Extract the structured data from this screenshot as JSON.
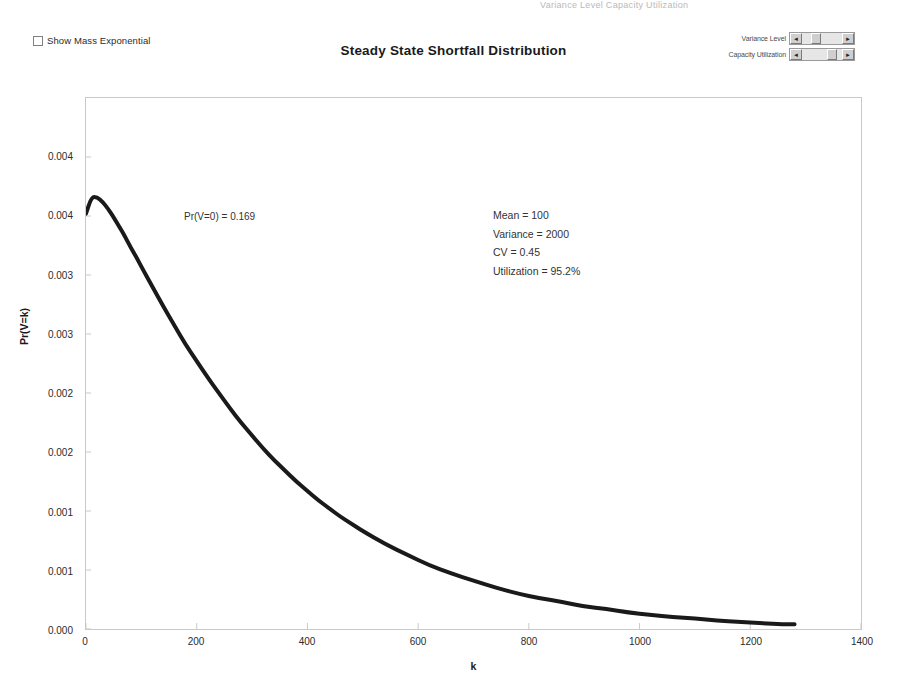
{
  "window": {
    "top_cutoff_text": "Variance Level                    Capacity Utilization"
  },
  "controls": {
    "show_mass_exponential": {
      "label": "Show Mass Exponential",
      "checked": false
    },
    "sliders": [
      {
        "name": "variance-level",
        "label": "Variance Level",
        "thumb_percent": 22,
        "left_arrow": "◄",
        "right_arrow": "►"
      },
      {
        "name": "capacity-utilization",
        "label": "Capacity Utilization",
        "thumb_percent": 63,
        "left_arrow": "◄",
        "right_arrow": "►"
      }
    ]
  },
  "chart_data": {
    "type": "line",
    "title": "Steady State Shortfall Distribution",
    "xlabel": "k",
    "ylabel": "Pr(V=k)",
    "xlim": [
      0,
      1400
    ],
    "ylim": [
      0,
      0.0045
    ],
    "grid": false,
    "legend": null,
    "xticks": [
      0,
      200,
      400,
      600,
      800,
      1000,
      1200,
      1400
    ],
    "xtick_labels": [
      "0",
      "200",
      "400",
      "600",
      "800",
      "1000",
      "1200",
      "1400"
    ],
    "yticks": [
      0.0045,
      0.004,
      0.0035,
      0.003,
      0.0025,
      0.002,
      0.0015,
      0.001,
      0.0005,
      0.0
    ],
    "ytick_labels": [
      "0.004",
      "0.004",
      "0.003",
      "0.003",
      "0.002",
      "0.002",
      "0.001",
      "0.001",
      "0.000"
    ],
    "ytick_values_shown": [
      0.004,
      0.0035,
      0.003,
      0.0025,
      0.002,
      0.0015,
      0.001,
      0.0005,
      0.0
    ],
    "series": [
      {
        "name": "Pr(V=k)",
        "color": "#1a1a1a",
        "line_width": 4,
        "x": [
          0,
          10,
          20,
          30,
          40,
          50,
          60,
          70,
          80,
          90,
          100,
          120,
          140,
          160,
          180,
          200,
          220,
          240,
          260,
          280,
          300,
          320,
          340,
          360,
          380,
          400,
          420,
          440,
          460,
          480,
          500,
          540,
          580,
          620,
          660,
          700,
          740,
          780,
          820,
          860,
          900,
          940,
          980,
          1020,
          1060,
          1100,
          1140,
          1180,
          1220,
          1260,
          1280
        ],
        "y": [
          0.00352,
          0.00366,
          0.00366,
          0.00362,
          0.00356,
          0.00349,
          0.00341,
          0.00333,
          0.00324,
          0.00316,
          0.00307,
          0.0029,
          0.00273,
          0.00257,
          0.00241,
          0.00227,
          0.00213,
          0.002,
          0.00187,
          0.00175,
          0.00164,
          0.00153,
          0.00143,
          0.00134,
          0.00125,
          0.00117,
          0.00109,
          0.00102,
          0.00095,
          0.00089,
          0.00083,
          0.00072,
          0.00063,
          0.00054,
          0.00047,
          0.00041,
          0.00035,
          0.0003,
          0.00026,
          0.00023,
          0.00019,
          0.00017,
          0.00014,
          0.00012,
          0.0001,
          9e-05,
          7e-05,
          6e-05,
          5e-05,
          4e-05,
          4e-05
        ]
      }
    ],
    "annotations": {
      "prob_zero": "Pr(V=0) = 0.169",
      "stats": [
        "Mean = 100",
        "Variance = 2000",
        "CV = 0.45",
        "Utilization = 95.2%"
      ]
    }
  }
}
